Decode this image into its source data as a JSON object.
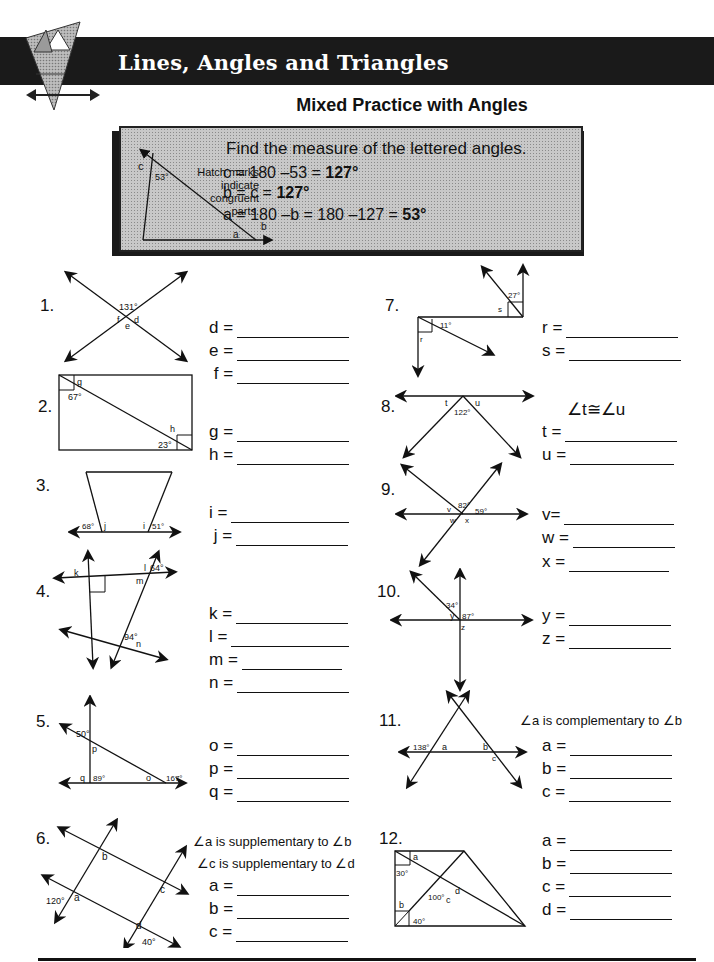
{
  "header": {
    "banner_title": "Lines, Angles and Triangles",
    "subtitle": "Mixed Practice with Angles",
    "logo_icon": "triangle-logo-icon"
  },
  "example": {
    "heading": "Find the measure of the lettered angles.",
    "hatch_note": [
      "Hatch marks",
      "indicate",
      "congruent",
      "parts."
    ],
    "diagram_labels": {
      "c": "c",
      "angle": "53°",
      "a": "a",
      "b": "b"
    },
    "lines": [
      {
        "text": "c = 180 –53 = ",
        "answer": "127°"
      },
      {
        "text": "b = c = ",
        "answer": "127°"
      },
      {
        "text": "a = 180 –b = 180 –127 =  ",
        "answer": "53°"
      }
    ]
  },
  "problems": [
    {
      "number": "1.",
      "given": [
        "131°"
      ],
      "letters": [
        "f",
        "d",
        "e"
      ],
      "answers": [
        {
          "label": "d ="
        },
        {
          "label": "e ="
        },
        {
          "label": " f ="
        }
      ]
    },
    {
      "number": "2.",
      "given": [
        "67°",
        "23°"
      ],
      "letters": [
        "g",
        "h"
      ],
      "answers": [
        {
          "label": "g ="
        },
        {
          "label": "h ="
        }
      ]
    },
    {
      "number": "3.",
      "given": [
        "68°",
        "51°"
      ],
      "letters": [
        "j",
        "i"
      ],
      "answers": [
        {
          "label": "i ="
        },
        {
          "label": " j ="
        }
      ]
    },
    {
      "number": "4.",
      "given": [
        "64°",
        "94°"
      ],
      "letters": [
        "k",
        "l",
        "m",
        "n"
      ],
      "answers": [
        {
          "label": "k ="
        },
        {
          "label": "l ="
        },
        {
          "label": "m ="
        },
        {
          "label": "n ="
        }
      ]
    },
    {
      "number": "5.",
      "given": [
        "50°",
        "89°",
        "167°"
      ],
      "letters": [
        "p",
        "q",
        "o"
      ],
      "answers": [
        {
          "label": "o ="
        },
        {
          "label": "p ="
        },
        {
          "label": "q ="
        }
      ]
    },
    {
      "number": "6.",
      "given": [
        "120°",
        "40°"
      ],
      "letters": [
        "a",
        "b",
        "c",
        "d"
      ],
      "notes": [
        "∠a is supplementary to ∠b",
        "∠c is supplementary to ∠d"
      ],
      "answers": [
        {
          "label": "a ="
        },
        {
          "label": "b ="
        },
        {
          "label": "c ="
        }
      ]
    },
    {
      "number": "7.",
      "given": [
        "27°",
        "11°"
      ],
      "letters": [
        "s",
        "r"
      ],
      "answers": [
        {
          "label": "r ="
        },
        {
          "label": "s ="
        }
      ]
    },
    {
      "number": "8.",
      "given": [
        "122°"
      ],
      "letters": [
        "t",
        "u"
      ],
      "notes": [
        "∠t≅∠u"
      ],
      "answers": [
        {
          "label": "t ="
        },
        {
          "label": "u ="
        }
      ]
    },
    {
      "number": "9.",
      "given": [
        "82°",
        "59°"
      ],
      "letters": [
        "v",
        "w",
        "x"
      ],
      "answers": [
        {
          "label": "v="
        },
        {
          "label": "w ="
        },
        {
          "label": "x ="
        }
      ]
    },
    {
      "number": "10.",
      "given": [
        "34°",
        "87°"
      ],
      "letters": [
        "y",
        "z"
      ],
      "answers": [
        {
          "label": "y ="
        },
        {
          "label": "z ="
        }
      ]
    },
    {
      "number": "11.",
      "given": [
        "138°"
      ],
      "letters": [
        "a",
        "b",
        "c"
      ],
      "notes": [
        "∠a is complementary to ∠b"
      ],
      "answers": [
        {
          "label": "a ="
        },
        {
          "label": "b ="
        },
        {
          "label": "c ="
        }
      ]
    },
    {
      "number": "12.",
      "given": [
        "30°",
        "100°",
        "40°"
      ],
      "letters": [
        "a",
        "b",
        "c",
        "d"
      ],
      "answers": [
        {
          "label": "a ="
        },
        {
          "label": "b ="
        },
        {
          "label": "c ="
        },
        {
          "label": "d ="
        }
      ]
    }
  ]
}
